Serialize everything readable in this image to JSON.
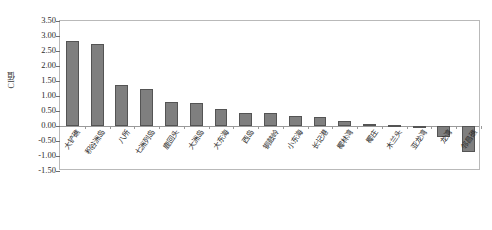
{
  "chart_data": {
    "type": "bar",
    "title": "",
    "subtitle": "",
    "xlabel": "",
    "ylabel": "CI值",
    "ylim": [
      -1.5,
      3.5
    ],
    "ytick_step": 0.5,
    "yticks": [
      "3.50",
      "3.00",
      "2.50",
      "2.00",
      "1.50",
      "1.00",
      "0.50",
      "0.00",
      "-0.50",
      "-1.00",
      "-1.50"
    ],
    "ytick_values": [
      3.5,
      3.0,
      2.5,
      2.0,
      1.5,
      1.0,
      0.5,
      0.0,
      -0.5,
      -1.0,
      -1.5
    ],
    "grid": false,
    "legend": false,
    "legend_position": "none",
    "bar_color": "#7f7f7f",
    "bar_border_color": "#545454",
    "plot_border_color": "#b9b9b9",
    "axis_color": "#6f6f6f",
    "categories": [
      "大铲礁",
      "积谷洲岛",
      "八所",
      "七洲列岛",
      "鹿回头",
      "大洲岛",
      "大东海",
      "西岛",
      "铜鼓岭",
      "小东海",
      "长记港",
      "椰林湾",
      "椰庄",
      "木兰头",
      "亚龙湾",
      "龙湾",
      "邻昌礁"
    ],
    "values": [
      2.85,
      2.73,
      1.37,
      1.25,
      0.8,
      0.76,
      0.57,
      0.45,
      0.45,
      0.35,
      0.29,
      0.18,
      0.07,
      0.02,
      -0.05,
      -0.35,
      -0.88
    ]
  }
}
